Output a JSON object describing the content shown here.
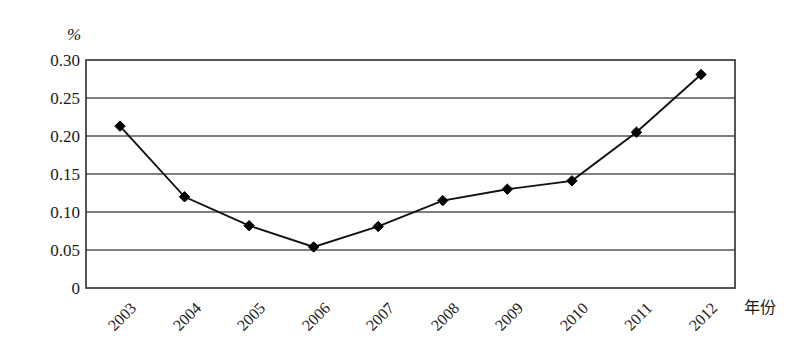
{
  "chart_data": {
    "type": "line",
    "title": "",
    "subtitle": "",
    "xlabel": "年份",
    "ylabel": "%",
    "categories": [
      "2003",
      "2004",
      "2005",
      "2006",
      "2007",
      "2008",
      "2009",
      "2010",
      "2011",
      "2012"
    ],
    "values": [
      0.213,
      0.12,
      0.082,
      0.054,
      0.081,
      0.115,
      0.13,
      0.141,
      0.205,
      0.281
    ],
    "series": [
      {
        "name": "",
        "values": [
          0.213,
          0.12,
          0.082,
          0.054,
          0.081,
          0.115,
          0.13,
          0.141,
          0.205,
          0.281
        ]
      }
    ],
    "ylim": [
      0,
      0.3
    ],
    "yticks": [
      "0",
      "0.05",
      "0.10",
      "0.15",
      "0.20",
      "0.25",
      "0.30"
    ],
    "ytick_values": [
      0,
      0.05,
      0.1,
      0.15,
      0.2,
      0.25,
      0.3
    ],
    "grid": "horizontal",
    "legend": "none",
    "marker": "diamond",
    "line_color": "#111111",
    "marker_color": "#000000",
    "grid_color": "#555555",
    "frame_color": "#444444",
    "background": "#ffffff",
    "annotations": []
  },
  "axis": {
    "unit_label": "%",
    "x_title": "年份"
  }
}
